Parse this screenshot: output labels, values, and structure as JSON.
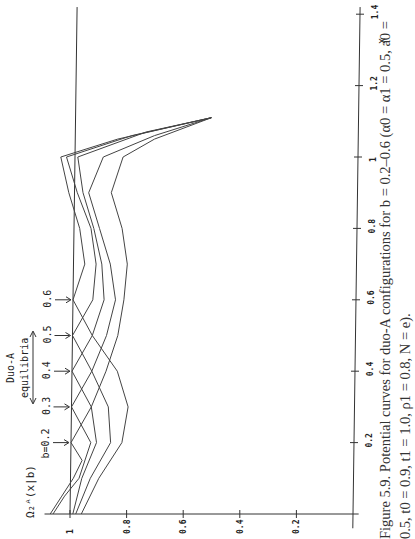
{
  "figure": {
    "caption": "Figure 5.9. Potential curves for duo-A configurations for b = 0.2–0.6 (α0 = α1 = 0.5, a0 = 0.5, t0 = 0.9, t1 = 1.0, ρ1 = 0.8, N = e)."
  },
  "labels": {
    "y_axis": "Ω₂ᴬ(x|b)",
    "x_axis": "x",
    "annotation_title_1": "Duo-A",
    "annotation_title_2": "equilibria",
    "b_labels": [
      "b=0.2",
      "0.3",
      "0.4",
      "0.5",
      "0.6"
    ]
  },
  "chart_data": {
    "type": "line",
    "title": "Potential curves for duo-A configurations for b = 0.2–0.6",
    "xlabel": "x",
    "ylabel": "Ω₂ᴬ(x|b)",
    "orientation": "rotated 90° counter-clockwise on page",
    "xlim": [
      0,
      1.4
    ],
    "ylim": [
      0,
      1.08
    ],
    "x_ticks": [
      0.2,
      0.4,
      0.6,
      0.8,
      1,
      1.2,
      1.4
    ],
    "y_ticks": [
      0.2,
      0.4,
      0.6,
      0.8,
      1
    ],
    "reference_line": 1.0,
    "annotations": [
      {
        "text": "b=0.2",
        "x": 0.2
      },
      {
        "text": "0.3",
        "x": 0.3
      },
      {
        "text": "0.4",
        "x": 0.4
      },
      {
        "text": "0.5",
        "x": 0.5
      },
      {
        "text": "0.6",
        "x": 0.6
      },
      {
        "text": "Duo-A equilibria",
        "x_range": [
          0.3,
          0.5
        ]
      }
    ],
    "series": [
      {
        "name": "b=0.2",
        "points": [
          [
            0,
            1.07
          ],
          [
            0.05,
            1.03
          ],
          [
            0.1,
            0.99
          ],
          [
            0.15,
            0.96
          ],
          [
            0.2,
            1.0
          ],
          [
            0.3,
            0.93
          ],
          [
            0.4,
            0.88
          ],
          [
            0.5,
            0.84
          ],
          [
            0.6,
            0.82
          ],
          [
            0.7,
            0.81
          ],
          [
            0.8,
            0.83
          ],
          [
            0.9,
            0.87
          ],
          [
            1.0,
            0.83
          ],
          [
            1.05,
            0.72
          ],
          [
            1.11,
            0.52
          ]
        ]
      },
      {
        "name": "b=0.3",
        "points": [
          [
            0,
            1.06
          ],
          [
            0.05,
            1.02
          ],
          [
            0.1,
            0.97
          ],
          [
            0.2,
            0.93
          ],
          [
            0.3,
            1.0
          ],
          [
            0.4,
            0.93
          ],
          [
            0.5,
            0.88
          ],
          [
            0.6,
            0.85
          ],
          [
            0.7,
            0.87
          ],
          [
            0.8,
            0.91
          ],
          [
            0.9,
            0.95
          ],
          [
            1.0,
            0.9
          ],
          [
            1.06,
            0.72
          ],
          [
            1.11,
            0.52
          ]
        ]
      },
      {
        "name": "b=0.4",
        "points": [
          [
            0,
            0.99
          ],
          [
            0.1,
            0.96
          ],
          [
            0.2,
            0.91
          ],
          [
            0.3,
            0.93
          ],
          [
            0.4,
            1.0
          ],
          [
            0.5,
            0.93
          ],
          [
            0.6,
            0.89
          ],
          [
            0.7,
            0.9
          ],
          [
            0.8,
            0.93
          ],
          [
            0.9,
            0.97
          ],
          [
            1.0,
            0.99
          ],
          [
            1.07,
            0.75
          ],
          [
            1.11,
            0.52
          ]
        ]
      },
      {
        "name": "b=0.5",
        "points": [
          [
            0,
            0.98
          ],
          [
            0.1,
            0.93
          ],
          [
            0.2,
            0.86
          ],
          [
            0.3,
            0.87
          ],
          [
            0.4,
            0.93
          ],
          [
            0.5,
            1.0
          ],
          [
            0.6,
            0.93
          ],
          [
            0.7,
            0.92
          ],
          [
            0.8,
            0.94
          ],
          [
            0.9,
            0.99
          ],
          [
            1.0,
            1.03
          ],
          [
            1.06,
            0.8
          ],
          [
            1.11,
            0.52
          ]
        ]
      },
      {
        "name": "b=0.6",
        "points": [
          [
            0,
            0.96
          ],
          [
            0.1,
            0.9
          ],
          [
            0.2,
            0.82
          ],
          [
            0.3,
            0.8
          ],
          [
            0.4,
            0.84
          ],
          [
            0.5,
            0.93
          ],
          [
            0.6,
            1.0
          ],
          [
            0.7,
            0.96
          ],
          [
            0.8,
            0.98
          ],
          [
            0.9,
            1.02
          ],
          [
            1.0,
            1.05
          ],
          [
            1.05,
            0.85
          ],
          [
            1.11,
            0.52
          ]
        ]
      }
    ]
  }
}
